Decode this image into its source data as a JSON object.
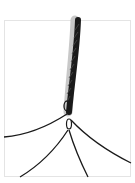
{
  "image": {
    "subject": "braided cord splitting into loose strands",
    "alt": "Photo of a black braided cord that unravels into several thin strands at the bottom",
    "colors": {
      "background": "#ffffff",
      "frame": "#e4e4e4",
      "cord": "#1a1a1a"
    }
  }
}
